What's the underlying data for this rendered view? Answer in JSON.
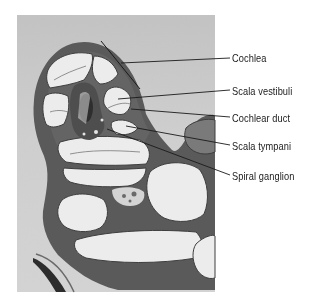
{
  "figure": {
    "type": "labeled light micrograph",
    "labels": [
      {
        "text": "Cochlea",
        "y": 52,
        "leader": {
          "x1": 121,
          "y1": 63,
          "x2": 230,
          "y2": 58
        }
      },
      {
        "text": "Scala vestibuli",
        "y": 85,
        "leader": {
          "x1": 118,
          "y1": 99,
          "x2": 230,
          "y2": 90
        }
      },
      {
        "text": "Cochlear duct",
        "y": 112,
        "leader": {
          "x1": 131,
          "y1": 109,
          "x2": 230,
          "y2": 117
        }
      },
      {
        "text": "Scala tympani",
        "y": 140,
        "leader": {
          "x1": 126,
          "y1": 126,
          "x2": 230,
          "y2": 145
        }
      },
      {
        "text": "Spiral ganglion",
        "y": 170,
        "leader": {
          "x1": 107,
          "y1": 129,
          "x2": 230,
          "y2": 175
        }
      }
    ],
    "bracket": {
      "x1": 101,
      "y1": 41,
      "x2": 140,
      "y2": 89
    },
    "colors": {
      "page_background": "#ffffff",
      "micrograph_background": "#d2d2d2",
      "tissue_dark": "#4a4a4a",
      "chamber_fill": "#ececec",
      "label_text": "#1a1a1a",
      "leader_line": "#1a1a1a"
    }
  }
}
